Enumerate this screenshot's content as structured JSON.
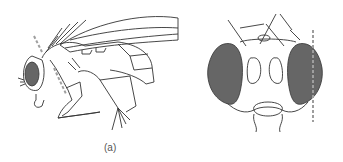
{
  "figure": {
    "panels": [
      {
        "id": "a",
        "label": "(a)",
        "view": "lateral view of fly"
      },
      {
        "id": "b",
        "label": "(b)",
        "view": "frontal view of fly head"
      }
    ],
    "colors": {
      "line": "#333333",
      "eye_fill": "#666666",
      "dashed_marker": "#9e9e9e",
      "background": "#ffffff"
    }
  }
}
